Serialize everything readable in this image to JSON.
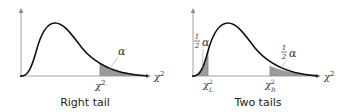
{
  "panels": [
    {
      "id": "right-tail",
      "caption": "Right tail",
      "axis_label": "χ",
      "axis_label_sup": "2",
      "area_label": "α",
      "critical_values": [
        {
          "base": "χ",
          "sup": "2",
          "sub": ""
        }
      ]
    },
    {
      "id": "two-tails",
      "caption": "Two tails",
      "axis_label": "χ",
      "axis_label_sup": "2",
      "left_area_label_num": "1",
      "left_area_label_den": "2",
      "left_area_label_sym": "α",
      "right_area_label_num": "1",
      "right_area_label_den": "2",
      "right_area_label_sym": "α",
      "critical_values": [
        {
          "base": "χ",
          "sup": "2",
          "sub": "L"
        },
        {
          "base": "χ",
          "sup": "2",
          "sub": "R"
        }
      ]
    }
  ],
  "colors": {
    "curve": "#111111",
    "axis": "#8a8a8a",
    "shade": "#9a9a9a",
    "leader": "#9a9a9a"
  }
}
